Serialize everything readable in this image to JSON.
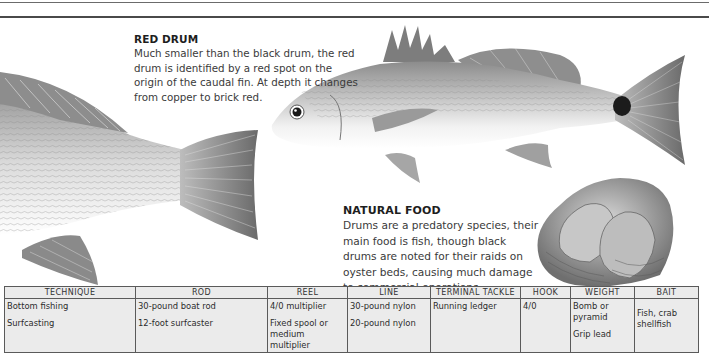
{
  "page": {
    "rules": 2
  },
  "red_drum": {
    "heading": "RED DRUM",
    "body": "Much smaller than the black drum, the red drum is identified by a red spot on the origin of the caudal fin. At depth it changes from  copper to brick red."
  },
  "natural_food": {
    "heading": "NATURAL FOOD",
    "body": "Drums are a predatory species, their main food is fish, though black drums are noted for their raids on oyster beds, causing much damage to commercial operations."
  },
  "illustrations": [
    {
      "name": "black-drum-tail",
      "description": "Rear half of black drum (tail section)"
    },
    {
      "name": "red-drum",
      "description": "Red drum fish with dark spot at caudal fin base"
    },
    {
      "name": "oyster-cluster",
      "description": "Cluster of oyster shells"
    }
  ],
  "table": {
    "headers": [
      "TECHNIQUE",
      "ROD",
      "REEL",
      "LINE",
      "TERMINAL TACKLE",
      "HOOK",
      "WEIGHT",
      "BAIT"
    ],
    "cells": {
      "technique": [
        "Bottom fishing",
        "Surfcasting"
      ],
      "rod": [
        "30-pound boat rod",
        "12-foot surfcaster"
      ],
      "reel": [
        "4/0 multiplier",
        "Fixed spool or medium multiplier"
      ],
      "line": [
        "30-pound nylon",
        "20-pound nylon"
      ],
      "terminal_tackle": [
        "Running ledger"
      ],
      "hook": [
        "4/0"
      ],
      "weight": [
        "Bomb or pyramid",
        "Grip lead"
      ],
      "bait": [
        "Fish, crab shellfish"
      ]
    }
  },
  "colors": {
    "table_bg": "#ebebeb",
    "grid": "#5a5a5a",
    "text": "#2a2a2a"
  }
}
